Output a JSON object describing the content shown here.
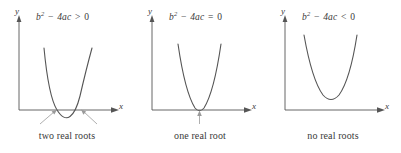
{
  "figure": {
    "stroke_color": "#555555",
    "text_color": "#3a3a3a",
    "background": "#ffffff"
  },
  "panels": [
    {
      "id": "positive-discriminant",
      "discriminant": {
        "base": "b",
        "exponent": "2",
        "minus": "−",
        "term": "4ac",
        "relation": ">",
        "value": "0",
        "full_text": "b² − 4ac > 0"
      },
      "axis": {
        "y_label": "y",
        "x_label": "x"
      },
      "caption": "two real roots",
      "roots_count": 2,
      "pointer_count": 2
    },
    {
      "id": "zero-discriminant",
      "discriminant": {
        "base": "b",
        "exponent": "2",
        "minus": "−",
        "term": "4ac",
        "relation": "=",
        "value": "0",
        "full_text": "b² − 4ac = 0"
      },
      "axis": {
        "y_label": "y",
        "x_label": "x"
      },
      "caption": "one real root",
      "roots_count": 1,
      "pointer_count": 1
    },
    {
      "id": "negative-discriminant",
      "discriminant": {
        "base": "b",
        "exponent": "2",
        "minus": "−",
        "term": "4ac",
        "relation": "<",
        "value": "0",
        "full_text": "b² − 4ac < 0"
      },
      "axis": {
        "y_label": "y",
        "x_label": "x"
      },
      "caption": "no real roots",
      "roots_count": 0,
      "pointer_count": 0
    }
  ]
}
